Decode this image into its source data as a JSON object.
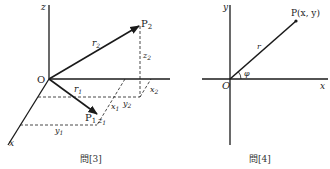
{
  "figures": [
    {
      "caption": "問[3]",
      "type": "3d-vector-diagram",
      "axes": {
        "x": "x",
        "y": "y",
        "z": "z"
      },
      "origin": "O",
      "points": [
        {
          "name": "P",
          "sub": "1"
        },
        {
          "name": "P",
          "sub": "2"
        }
      ],
      "vectors": [
        {
          "name": "r",
          "sub": "1"
        },
        {
          "name": "r",
          "sub": "2"
        }
      ],
      "components": {
        "x1": {
          "base": "x",
          "sub": "1"
        },
        "y1": {
          "base": "y",
          "sub": "1"
        },
        "z1": {
          "base": "z",
          "sub": "1"
        },
        "x2": {
          "base": "x",
          "sub": "2"
        },
        "y2": {
          "base": "y",
          "sub": "2"
        },
        "z2": {
          "base": "z",
          "sub": "2"
        }
      }
    },
    {
      "caption": "問[4]",
      "type": "polar-coordinate-diagram",
      "axes": {
        "x": "x",
        "y": "y"
      },
      "origin": "O",
      "point": "P(x, y)",
      "radius": "r",
      "angle": "φ"
    }
  ],
  "colors": {
    "ink": "#1a1a1a",
    "background": "#ffffff"
  }
}
